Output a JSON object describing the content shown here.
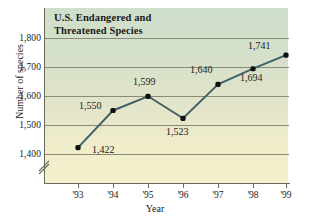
{
  "chart_data": {
    "type": "line",
    "title": "U.S. Endangered and Threatened Species",
    "title_line1": "U.S. Endangered and",
    "title_line2": "Threatened Species",
    "xlabel": "Year",
    "ylabel": "Number of species",
    "categories": [
      "'93",
      "'94",
      "'95",
      "'96",
      "'97",
      "'98",
      "'99"
    ],
    "values": [
      1422,
      1550,
      1599,
      1523,
      1640,
      1694,
      1741
    ],
    "point_labels": [
      "1,422",
      "1,550",
      "1,599",
      "1,523",
      "1,640",
      "1,694",
      "1,741"
    ],
    "ylim": [
      1400,
      1800
    ],
    "yticks": [
      1800,
      1700,
      1600,
      1500,
      1400
    ],
    "ytick_labels": [
      "1,800",
      "1,700",
      "1,600",
      "1,500",
      "1,400"
    ],
    "grid": true,
    "legend": "none",
    "axis_break": true,
    "series_color": "#3d5f66",
    "marker_color": "#111111",
    "grid_color": "#8a8a76",
    "axis_color": "#6b6b5e",
    "background_top_color": "#cfdfcb",
    "background_bottom_color": "#f4f0cd"
  }
}
